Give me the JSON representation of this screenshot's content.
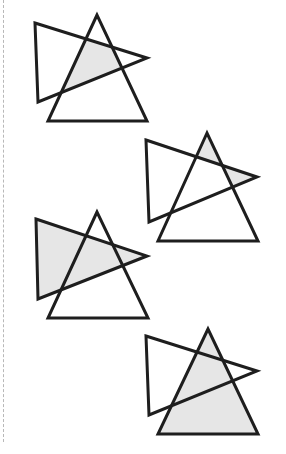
{
  "page": {
    "title_fragment": "",
    "background": "#ffffff",
    "line_color": "#1e1e1e",
    "shade_color": "#e6e6e6",
    "margin_line": "dashed"
  },
  "figures": [
    {
      "id": "figure-1",
      "shaded_region": "intersection",
      "upright_triangle": [
        [
          97,
          15
        ],
        [
          48,
          121
        ],
        [
          147,
          121
        ]
      ],
      "sideways_triangle": [
        [
          35,
          23
        ],
        [
          147,
          58
        ],
        [
          38,
          102
        ]
      ]
    },
    {
      "id": "figure-2",
      "shaded_region": "outer-tips",
      "upright_triangle": [
        [
          207,
          133
        ],
        [
          158,
          241
        ],
        [
          258,
          241
        ]
      ],
      "sideways_triangle": [
        [
          146,
          140
        ],
        [
          257,
          177
        ],
        [
          149,
          222
        ]
      ]
    },
    {
      "id": "figure-3",
      "shaded_region": "sideways-triangle",
      "upright_triangle": [
        [
          97,
          212
        ],
        [
          48,
          318
        ],
        [
          148,
          318
        ]
      ],
      "sideways_triangle": [
        [
          36,
          219
        ],
        [
          147,
          256
        ],
        [
          38,
          299
        ]
      ]
    },
    {
      "id": "figure-4",
      "shaded_region": "upright-triangle",
      "upright_triangle": [
        [
          208,
          329
        ],
        [
          158,
          434
        ],
        [
          258,
          434
        ]
      ],
      "sideways_triangle": [
        [
          146,
          336
        ],
        [
          257,
          371
        ],
        [
          149,
          415
        ]
      ]
    }
  ]
}
